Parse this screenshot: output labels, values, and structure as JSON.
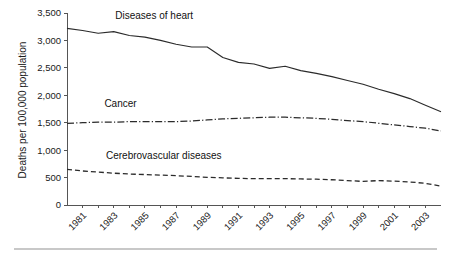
{
  "chart_data": {
    "type": "line",
    "title": "",
    "subtitle": "",
    "xlabel": "",
    "ylabel": "Deaths per 100,000 population",
    "ylim": [
      0,
      3500
    ],
    "ytick_values": [
      0,
      500,
      1000,
      1500,
      2000,
      2500,
      3000,
      3500
    ],
    "ytick_labels": [
      "0",
      "500",
      "1,000",
      "1,500",
      "2,000",
      "2,500",
      "3,000",
      "3,500"
    ],
    "xlim": [
      1980,
      2004
    ],
    "x": [
      1980,
      1981,
      1982,
      1983,
      1984,
      1985,
      1986,
      1987,
      1988,
      1989,
      1990,
      1991,
      1992,
      1993,
      1994,
      1995,
      1996,
      1997,
      1998,
      1999,
      2000,
      2001,
      2002,
      2003,
      2004
    ],
    "xtick_values": [
      1981,
      1983,
      1985,
      1987,
      1989,
      1991,
      1993,
      1995,
      1997,
      1999,
      2001,
      2003
    ],
    "xtick_labels": [
      "1981",
      "1983",
      "1985",
      "1987",
      "1989",
      "1991",
      "1993",
      "1995",
      "1997",
      "1999",
      "2001",
      "2003"
    ],
    "xtick_label_rotation": -45,
    "grid": false,
    "legend_position": "inline-annotations",
    "series": [
      {
        "name": "Diseases of heart",
        "label": "Diseases of heart",
        "style": "solid",
        "color": "#2b2b2b",
        "values": [
          3220,
          3180,
          3130,
          3160,
          3090,
          3060,
          3000,
          2930,
          2880,
          2880,
          2690,
          2600,
          2570,
          2490,
          2530,
          2450,
          2400,
          2340,
          2270,
          2200,
          2110,
          2030,
          1940,
          1820,
          1700
        ]
      },
      {
        "name": "Cancer",
        "label": "Cancer",
        "style": "dash-dot",
        "color": "#2b2b2b",
        "values": [
          1490,
          1500,
          1510,
          1510,
          1520,
          1520,
          1520,
          1520,
          1530,
          1550,
          1570,
          1580,
          1590,
          1600,
          1600,
          1590,
          1580,
          1560,
          1540,
          1520,
          1490,
          1460,
          1430,
          1400,
          1350
        ]
      },
      {
        "name": "Cerebrovascular diseases",
        "label": "Cerebrovascular diseases",
        "style": "dashed",
        "color": "#2b2b2b",
        "values": [
          650,
          620,
          600,
          580,
          565,
          555,
          545,
          535,
          520,
          505,
          495,
          485,
          480,
          480,
          480,
          475,
          470,
          460,
          445,
          430,
          445,
          435,
          420,
          395,
          345
        ]
      }
    ],
    "annotations": [
      {
        "text": "Diseases of heart",
        "x": 1983.1,
        "y": 3390
      },
      {
        "text": "Cancer",
        "x": 1982.4,
        "y": 1790
      },
      {
        "text": "Cerebrovascular diseases",
        "x": 1982.5,
        "y": 840
      }
    ]
  },
  "figure": {
    "background_color": "#ffffff",
    "axis_color": "#555555",
    "line_color": "#2b2b2b",
    "rule_color": "#c8c8c8"
  }
}
